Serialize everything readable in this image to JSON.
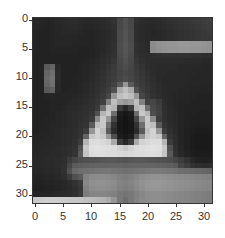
{
  "chart_data": {
    "type": "heatmap",
    "title": "",
    "xlabel": "",
    "ylabel": "",
    "colormap": "gray",
    "xlim": [
      -0.5,
      31.5
    ],
    "ylim": [
      31.5,
      -0.5
    ],
    "x_ticks": [
      "0",
      "5",
      "10",
      "15",
      "20",
      "25",
      "30"
    ],
    "y_ticks": [
      "0",
      "5",
      "10",
      "15",
      "20",
      "25",
      "30"
    ],
    "grid": false,
    "shape": [
      32,
      32
    ],
    "values": [
      [
        40,
        38,
        36,
        38,
        40,
        42,
        44,
        44,
        42,
        40,
        40,
        42,
        44,
        46,
        50,
        70,
        80,
        70,
        48,
        44,
        42,
        42,
        44,
        46,
        48,
        50,
        52,
        54,
        56,
        58,
        60,
        62
      ],
      [
        38,
        36,
        34,
        36,
        38,
        40,
        42,
        42,
        40,
        38,
        38,
        40,
        42,
        44,
        48,
        72,
        82,
        72,
        46,
        42,
        40,
        40,
        42,
        44,
        46,
        48,
        50,
        52,
        54,
        56,
        58,
        60
      ],
      [
        36,
        34,
        34,
        36,
        38,
        40,
        40,
        40,
        38,
        36,
        36,
        38,
        40,
        42,
        46,
        74,
        84,
        74,
        46,
        42,
        40,
        38,
        40,
        42,
        44,
        46,
        48,
        50,
        52,
        54,
        56,
        58
      ],
      [
        36,
        34,
        34,
        36,
        38,
        38,
        38,
        38,
        36,
        36,
        36,
        38,
        40,
        42,
        46,
        74,
        84,
        74,
        46,
        42,
        40,
        40,
        40,
        42,
        44,
        46,
        48,
        50,
        52,
        54,
        56,
        56
      ],
      [
        36,
        34,
        34,
        36,
        38,
        38,
        38,
        36,
        36,
        36,
        36,
        38,
        40,
        44,
        48,
        76,
        86,
        76,
        48,
        44,
        42,
        140,
        146,
        148,
        150,
        150,
        152,
        152,
        150,
        150,
        148,
        146
      ],
      [
        36,
        34,
        34,
        36,
        36,
        36,
        36,
        36,
        34,
        34,
        36,
        38,
        40,
        44,
        48,
        76,
        86,
        76,
        48,
        44,
        42,
        138,
        144,
        146,
        148,
        148,
        150,
        150,
        148,
        148,
        146,
        144
      ],
      [
        34,
        34,
        34,
        34,
        34,
        34,
        34,
        34,
        34,
        34,
        36,
        38,
        42,
        46,
        50,
        74,
        84,
        74,
        50,
        46,
        44,
        46,
        48,
        50,
        50,
        50,
        50,
        50,
        48,
        48,
        46,
        46
      ],
      [
        34,
        34,
        34,
        34,
        34,
        34,
        34,
        34,
        34,
        36,
        38,
        40,
        44,
        48,
        54,
        72,
        80,
        72,
        54,
        48,
        44,
        44,
        44,
        44,
        44,
        44,
        44,
        42,
        42,
        42,
        40,
        40
      ],
      [
        34,
        34,
        90,
        100,
        40,
        34,
        34,
        34,
        36,
        38,
        40,
        42,
        46,
        52,
        58,
        70,
        76,
        70,
        58,
        52,
        46,
        44,
        42,
        42,
        42,
        42,
        40,
        40,
        40,
        40,
        38,
        38
      ],
      [
        34,
        34,
        100,
        110,
        42,
        34,
        34,
        34,
        36,
        38,
        40,
        44,
        48,
        54,
        60,
        68,
        72,
        68,
        60,
        54,
        48,
        44,
        42,
        42,
        40,
        40,
        40,
        40,
        40,
        38,
        38,
        38
      ],
      [
        34,
        34,
        104,
        114,
        42,
        34,
        34,
        36,
        36,
        38,
        42,
        46,
        50,
        56,
        62,
        70,
        76,
        70,
        62,
        56,
        50,
        46,
        42,
        40,
        40,
        40,
        40,
        40,
        38,
        38,
        38,
        38
      ],
      [
        34,
        34,
        100,
        110,
        40,
        34,
        34,
        36,
        38,
        40,
        44,
        48,
        52,
        58,
        66,
        90,
        150,
        90,
        66,
        58,
        52,
        48,
        44,
        40,
        40,
        40,
        40,
        38,
        38,
        38,
        36,
        36
      ],
      [
        34,
        34,
        90,
        96,
        40,
        34,
        36,
        36,
        38,
        40,
        44,
        48,
        54,
        62,
        80,
        170,
        190,
        170,
        80,
        62,
        54,
        48,
        44,
        42,
        40,
        40,
        38,
        38,
        36,
        36,
        36,
        36
      ],
      [
        34,
        34,
        36,
        38,
        36,
        36,
        36,
        38,
        40,
        42,
        46,
        50,
        58,
        70,
        150,
        190,
        200,
        190,
        150,
        70,
        58,
        50,
        46,
        42,
        40,
        38,
        38,
        36,
        36,
        34,
        34,
        34
      ],
      [
        34,
        34,
        34,
        36,
        36,
        36,
        38,
        40,
        42,
        44,
        48,
        54,
        64,
        130,
        190,
        160,
        150,
        160,
        190,
        130,
        64,
        70,
        60,
        44,
        40,
        38,
        36,
        36,
        34,
        34,
        34,
        34
      ],
      [
        34,
        34,
        34,
        36,
        36,
        38,
        40,
        42,
        44,
        46,
        50,
        58,
        110,
        190,
        180,
        60,
        40,
        60,
        180,
        190,
        110,
        74,
        64,
        46,
        42,
        38,
        36,
        34,
        34,
        34,
        34,
        34
      ],
      [
        34,
        34,
        34,
        36,
        38,
        40,
        42,
        44,
        46,
        48,
        54,
        80,
        180,
        200,
        110,
        30,
        24,
        30,
        110,
        200,
        180,
        78,
        66,
        48,
        42,
        40,
        36,
        34,
        34,
        32,
        32,
        32
      ],
      [
        34,
        34,
        36,
        36,
        38,
        40,
        42,
        44,
        46,
        50,
        58,
        140,
        200,
        150,
        70,
        26,
        20,
        26,
        70,
        150,
        200,
        140,
        60,
        48,
        42,
        40,
        36,
        34,
        32,
        32,
        32,
        32
      ],
      [
        34,
        34,
        36,
        38,
        38,
        40,
        42,
        44,
        48,
        52,
        90,
        190,
        200,
        110,
        50,
        24,
        20,
        24,
        50,
        110,
        200,
        190,
        90,
        52,
        44,
        40,
        36,
        34,
        32,
        30,
        30,
        30
      ],
      [
        34,
        36,
        36,
        38,
        40,
        42,
        44,
        46,
        50,
        60,
        150,
        210,
        190,
        90,
        44,
        24,
        20,
        24,
        44,
        90,
        190,
        210,
        150,
        60,
        48,
        42,
        36,
        32,
        30,
        28,
        28,
        28
      ],
      [
        36,
        36,
        38,
        38,
        40,
        42,
        44,
        46,
        52,
        100,
        200,
        210,
        200,
        150,
        80,
        30,
        24,
        30,
        80,
        150,
        200,
        210,
        200,
        100,
        52,
        44,
        36,
        32,
        28,
        26,
        26,
        26
      ],
      [
        36,
        38,
        38,
        40,
        40,
        42,
        44,
        48,
        60,
        180,
        220,
        220,
        216,
        210,
        170,
        60,
        40,
        60,
        170,
        210,
        216,
        220,
        220,
        180,
        60,
        46,
        36,
        32,
        28,
        26,
        26,
        26
      ],
      [
        38,
        38,
        40,
        40,
        42,
        44,
        46,
        50,
        80,
        200,
        224,
        226,
        224,
        222,
        220,
        210,
        200,
        210,
        220,
        222,
        224,
        226,
        224,
        200,
        80,
        48,
        38,
        32,
        28,
        26,
        26,
        26
      ],
      [
        38,
        40,
        40,
        42,
        42,
        44,
        46,
        52,
        90,
        196,
        220,
        222,
        222,
        220,
        220,
        218,
        216,
        218,
        220,
        220,
        222,
        222,
        220,
        196,
        90,
        50,
        40,
        34,
        30,
        28,
        28,
        28
      ],
      [
        40,
        40,
        42,
        42,
        44,
        46,
        60,
        70,
        78,
        80,
        82,
        84,
        86,
        88,
        88,
        86,
        84,
        86,
        88,
        88,
        86,
        84,
        82,
        80,
        78,
        70,
        60,
        50,
        40,
        34,
        32,
        32
      ],
      [
        40,
        40,
        42,
        42,
        44,
        48,
        70,
        90,
        94,
        96,
        98,
        100,
        100,
        100,
        100,
        100,
        98,
        100,
        100,
        100,
        100,
        100,
        98,
        96,
        94,
        90,
        70,
        60,
        50,
        46,
        44,
        44
      ],
      [
        38,
        38,
        40,
        40,
        42,
        48,
        80,
        104,
        110,
        112,
        114,
        116,
        118,
        118,
        116,
        114,
        112,
        114,
        116,
        118,
        120,
        122,
        122,
        120,
        118,
        116,
        110,
        108,
        106,
        104,
        102,
        100
      ],
      [
        36,
        36,
        38,
        38,
        40,
        46,
        60,
        80,
        90,
        130,
        138,
        140,
        140,
        138,
        134,
        128,
        124,
        128,
        134,
        140,
        144,
        146,
        146,
        144,
        142,
        140,
        138,
        136,
        134,
        132,
        130,
        128
      ],
      [
        34,
        34,
        36,
        36,
        38,
        40,
        44,
        50,
        58,
        136,
        144,
        146,
        146,
        144,
        140,
        132,
        128,
        132,
        140,
        146,
        150,
        152,
        152,
        150,
        148,
        146,
        144,
        142,
        140,
        138,
        136,
        134
      ],
      [
        32,
        32,
        34,
        34,
        36,
        38,
        42,
        46,
        54,
        130,
        140,
        142,
        142,
        140,
        136,
        128,
        124,
        128,
        136,
        142,
        148,
        150,
        150,
        148,
        146,
        144,
        142,
        140,
        138,
        136,
        134,
        132
      ],
      [
        36,
        36,
        36,
        38,
        40,
        42,
        44,
        48,
        56,
        124,
        132,
        134,
        134,
        132,
        128,
        120,
        116,
        120,
        128,
        134,
        140,
        142,
        142,
        140,
        138,
        136,
        134,
        132,
        130,
        128,
        126,
        124
      ],
      [
        200,
        204,
        206,
        206,
        204,
        202,
        200,
        198,
        196,
        192,
        188,
        184,
        180,
        170,
        150,
        120,
        110,
        120,
        130,
        136,
        140,
        142,
        142,
        140,
        138,
        136,
        134,
        132,
        130,
        128,
        126,
        124
      ]
    ]
  }
}
